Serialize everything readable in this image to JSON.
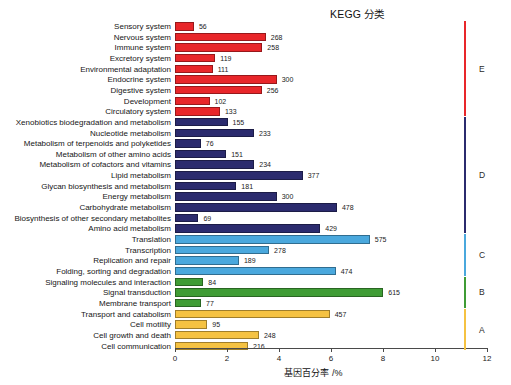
{
  "title": "KEGG 分类",
  "axis": {
    "x_label": "基因百分率 /%",
    "x_min": 0,
    "x_max": 12,
    "x_ticks": [
      "0",
      "2",
      "4",
      "6",
      "8",
      "10",
      "12"
    ]
  },
  "colors": {
    "red": "#e8262a",
    "navy": "#2b2b6e",
    "skyblue": "#4aa8dd",
    "green": "#3f9c35",
    "gold": "#f5c242"
  },
  "chart_data": {
    "type": "bar",
    "orientation": "horizontal",
    "title": "KEGG 分类",
    "xlabel": "基因百分率 /%",
    "ylabel": "",
    "xlim": [
      0,
      12
    ],
    "grid": false,
    "legend": "right-brackets",
    "categories": [
      "Sensory system",
      "Nervous system",
      "Immune system",
      "Excretory system",
      "Environmental adaptation",
      "Endocrine system",
      "Digestive system",
      "Development",
      "Circulatory system",
      "Xenobiotics biodegradation and metabolism",
      "Nucleotide metabolism",
      "Metabolism of terpenoids and polyketides",
      "Metabolism of other amino acids",
      "Metabolism of cofactors and vitamins",
      "Lipid metabolism",
      "Glycan biosynthesis and metabolism",
      "Energy metabolism",
      "Carbohydrate metabolism",
      "Biosynthesis of other secondary metabolites",
      "Amino acid metabolism",
      "Translation",
      "Transcription",
      "Replication and repair",
      "Folding, sorting and degradation",
      "Signaling molecules and interaction",
      "Signal transduction",
      "Membrane transport",
      "Transport and catabolism",
      "Cell motility",
      "Cell growth and death",
      "Cell communication"
    ],
    "counts": [
      56,
      268,
      258,
      119,
      111,
      300,
      256,
      102,
      133,
      155,
      233,
      76,
      151,
      234,
      377,
      181,
      300,
      478,
      69,
      429,
      575,
      278,
      189,
      474,
      84,
      615,
      77,
      457,
      95,
      248,
      216
    ],
    "percent_values": [
      0.73,
      3.49,
      3.36,
      1.55,
      1.45,
      3.91,
      3.34,
      1.33,
      1.73,
      2.02,
      3.04,
      0.99,
      1.97,
      3.05,
      4.91,
      2.36,
      3.91,
      6.23,
      0.9,
      5.59,
      7.49,
      3.62,
      2.46,
      6.18,
      1.09,
      8.01,
      1.0,
      5.95,
      1.24,
      3.23,
      2.81
    ],
    "group_of_bar": [
      "E",
      "E",
      "E",
      "E",
      "E",
      "E",
      "E",
      "E",
      "E",
      "D",
      "D",
      "D",
      "D",
      "D",
      "D",
      "D",
      "D",
      "D",
      "D",
      "D",
      "C",
      "C",
      "C",
      "C",
      "B",
      "B",
      "B",
      "A",
      "A",
      "A",
      "A"
    ]
  },
  "groups": [
    {
      "letter": "E",
      "label": "Organismal Systems",
      "color": "#e8262a",
      "first": 0,
      "last": 8
    },
    {
      "letter": "D",
      "label": "Metabolism",
      "color": "#2b2b6e",
      "first": 9,
      "last": 19
    },
    {
      "letter": "C",
      "label": "Genetic Information Processing",
      "color": "#4aa8dd",
      "first": 20,
      "last": 23
    },
    {
      "letter": "B",
      "label": "Environmental Information Processing",
      "color": "#3f9c35",
      "first": 24,
      "last": 26
    },
    {
      "letter": "A",
      "label": "Cellular Processes",
      "color": "#f5c242",
      "first": 27,
      "last": 30
    }
  ]
}
